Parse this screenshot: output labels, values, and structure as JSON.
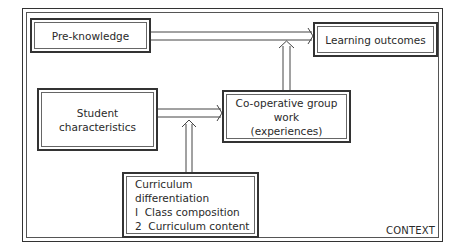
{
  "diagram": {
    "context_label": "CONTEXT",
    "nodes": {
      "pre_knowledge": {
        "label": "Pre-knowledge"
      },
      "learning_outcomes": {
        "label": "Learning outcomes"
      },
      "student_characteristics": {
        "line1": "Student",
        "line2": "characteristics"
      },
      "cooperative_group_work": {
        "line1": "Co-operative group work",
        "line2": "(experiences)"
      },
      "curriculum_differentiation": {
        "title": "Curriculum differentiation",
        "items": [
          "I  Class composition",
          "2  Curriculum content"
        ]
      }
    },
    "edges": [
      {
        "from": "Pre-knowledge",
        "to": "Learning outcomes"
      },
      {
        "from": "Student characteristics",
        "to": "Co-operative group work (experiences)"
      },
      {
        "from": "Curriculum differentiation",
        "to": "Student characteristics → Co-operative group work edge"
      },
      {
        "from": "Co-operative group work (experiences)",
        "to": "Learning outcomes"
      }
    ],
    "colors": {
      "line": "#333333",
      "background": "#ffffff"
    }
  }
}
